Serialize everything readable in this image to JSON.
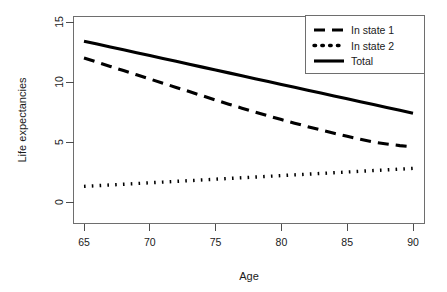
{
  "chart_data": {
    "type": "line",
    "title": "",
    "subtitle": "",
    "xlabel": "Age",
    "ylabel": "Life expectancies",
    "xlim": [
      63.5,
      91.5
    ],
    "ylim": [
      0,
      15.6
    ],
    "xticks": [
      65,
      70,
      75,
      80,
      85,
      90
    ],
    "xticklabels": [
      "65",
      "70",
      "75",
      "80",
      "85",
      "90"
    ],
    "yticks": [
      0,
      5,
      10,
      15
    ],
    "yticklabels": [
      "0",
      "5",
      "10",
      "15"
    ],
    "grid": false,
    "legend_position": "top-right",
    "x": [
      65,
      66,
      67,
      68,
      69,
      70,
      71,
      72,
      73,
      74,
      75,
      76,
      77,
      78,
      79,
      80,
      81,
      82,
      83,
      84,
      85,
      86,
      87,
      88,
      89,
      90
    ],
    "series": [
      {
        "name": "In state 1",
        "style": "dashed",
        "color": "#000000",
        "values": [
          12.0,
          11.65,
          11.3,
          10.95,
          10.6,
          10.25,
          9.9,
          9.55,
          9.2,
          8.85,
          8.5,
          8.15,
          7.82,
          7.5,
          7.18,
          6.87,
          6.57,
          6.28,
          6.0,
          5.73,
          5.47,
          5.22,
          4.99,
          4.84,
          4.7,
          4.6
        ]
      },
      {
        "name": "In state 2",
        "style": "dotted",
        "color": "#000000",
        "values": [
          1.3,
          1.36,
          1.42,
          1.48,
          1.54,
          1.6,
          1.66,
          1.72,
          1.78,
          1.84,
          1.9,
          1.96,
          2.02,
          2.08,
          2.14,
          2.2,
          2.26,
          2.32,
          2.38,
          2.44,
          2.5,
          2.56,
          2.62,
          2.68,
          2.74,
          2.8
        ]
      },
      {
        "name": "Total",
        "style": "solid",
        "color": "#000000",
        "values": [
          13.4,
          13.16,
          12.92,
          12.68,
          12.44,
          12.2,
          11.96,
          11.72,
          11.48,
          11.24,
          11.0,
          10.76,
          10.52,
          10.28,
          10.04,
          9.8,
          9.56,
          9.32,
          9.08,
          8.84,
          8.6,
          8.36,
          8.12,
          7.88,
          7.64,
          7.4
        ]
      }
    ],
    "legend": [
      {
        "label": "In state 1",
        "style": "dashed"
      },
      {
        "label": "In state 2",
        "style": "dotted"
      },
      {
        "label": "Total",
        "style": "solid"
      }
    ]
  }
}
